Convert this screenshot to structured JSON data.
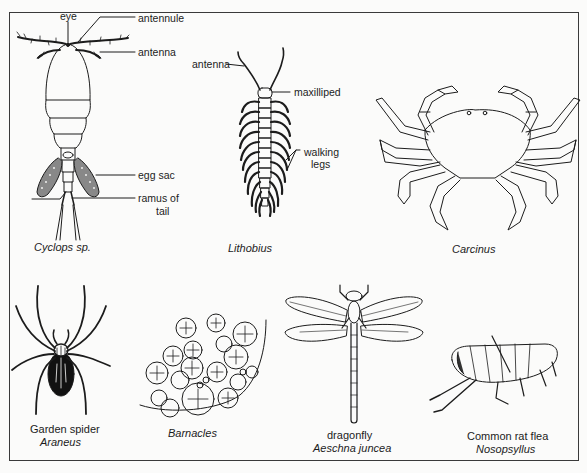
{
  "figure": {
    "panels": [
      {
        "id": "cyclops",
        "caption": "Cyclops sp.",
        "caption_italic": true,
        "labels": [
          "eye",
          "antennule",
          "antenna",
          "egg sac",
          "ramus of",
          "tail"
        ]
      },
      {
        "id": "lithobius",
        "caption": "Lithobius",
        "caption_italic": true,
        "labels": [
          "antenna",
          "maxilliped",
          "walking",
          "legs"
        ]
      },
      {
        "id": "carcinus",
        "caption": "Carcinus",
        "caption_italic": true,
        "labels": []
      },
      {
        "id": "garden-spider",
        "common_name": "Garden spider",
        "caption": "Araneus",
        "caption_italic": true
      },
      {
        "id": "barnacles",
        "caption": "Barnacles",
        "caption_italic": true
      },
      {
        "id": "dragonfly",
        "common_name": "dragonfly",
        "caption": "Aeschna juncea",
        "caption_italic": true
      },
      {
        "id": "rat-flea",
        "common_name": "Common rat flea",
        "caption": "Nosopsyllus",
        "caption_italic": true
      }
    ],
    "colors": {
      "ink": "#1c1c1c",
      "paper": "#fbfbfa",
      "border": "#3a3a3a"
    }
  }
}
